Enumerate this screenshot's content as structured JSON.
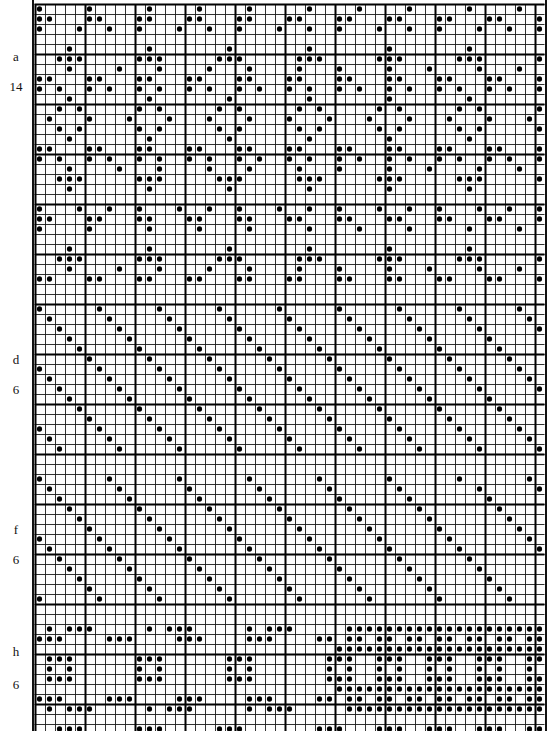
{
  "document": {
    "type": "filet-crochet-chart",
    "title": "",
    "page_width": 559,
    "page_height": 740
  },
  "margin_labels": [
    {
      "letter": "a",
      "number": "14",
      "letter_y": 50,
      "number_y": 80
    },
    {
      "letter": "d",
      "number": "6",
      "letter_y": 353,
      "number_y": 383
    },
    {
      "letter": "f",
      "number": "6",
      "letter_y": 523,
      "number_y": 553
    },
    {
      "letter": "h",
      "number": "6",
      "letter_y": 645,
      "number_y": 678
    }
  ],
  "grid": {
    "left": 32,
    "top": 4,
    "cols": 51,
    "rows": 73,
    "cell_w": 10.0,
    "cell_h": 10.0,
    "thin_line_color": "#1a1a1a",
    "heavy_line_color": "#000000",
    "thin_line_width": 0.9,
    "heavy_line_width": 2.0,
    "heavy_every": 5,
    "background": "#fdfdfd",
    "dot_color": "#000000",
    "dot_radius": 2.6
  },
  "chart_data": {
    "type": "heatmap",
    "title": "",
    "xlabel": "",
    "ylabel": "",
    "legend": [],
    "categories": [],
    "sections": [
      {
        "id": "a",
        "repeat": "14",
        "row_start": 0,
        "row_end": 27
      },
      {
        "id": "d",
        "repeat": "6",
        "row_start": 30,
        "row_end": 44
      },
      {
        "id": "f",
        "repeat": "6",
        "row_start": 47,
        "row_end": 60
      },
      {
        "id": "h",
        "repeat": "6",
        "row_start": 62,
        "row_end": 72
      }
    ],
    "rows": [
      "100001000001000010000100000100001000010000010000100",
      "110001100011000110001100011000110001100011000110001",
      "100010010010001001001000100100100010010010001001001",
      "000000000000000000000000000000000000000000000000000",
      "000100000001000000010000000100000001000000010000000",
      "001110000011100000111000001110000011100000111000001",
      "000100001000100001000100001000100001000100001000100",
      "110001100011000110001100011000110001100011000110001",
      "101001010010100101001010010100101001010010100101001",
      "000100000001000000010000000100000001000000010000000",
      "001010000010100000101000001010000010100000101000001",
      "010001000100010001000100010001000100010001000100010",
      "001010000010100000101000001010000010100000101000001",
      "000100000001000000010000000100000001000000010000000",
      "110001100011000110001100011000110001100011000110001",
      "101001010010100101001010010100101001010010100101001",
      "000100001000100001000100001000100001000100001000100",
      "001110000011100000111000001110000011100000111000001",
      "000100000001000000010000000100000001000000010000000",
      "000000000000000000000000000000000000000000000000000",
      "100010010010001001001000100100100010010010001001001",
      "110001100011000110001100011000110001100011000110001",
      "100001000001000010000100000100001000010000010000100",
      "000000000000000000000000000000000000000000000000000",
      "000100000001000000010000000100000001000000010000000",
      "001110000011100000111000001110000011100000111000001",
      "000100001000100001000100001000100001000100001000100",
      "110001100011000110001100011000110001100011000110001",
      "000000000000000000000000000000000000000000000000000",
      "000000000000000000000000000000000000000000000000000",
      "100000100000100000100000100000100000100000100000100",
      "010000010000010000010000010000010000010000010000010",
      "001000001000001000001000001000001000001000001000001",
      "000100000100000100000100000100000100000100000100000",
      "000010000010000010000010000010000010000010000010000",
      "000001000001000001000001000001000001000001000001000",
      "100000100000100000100000100000100000100000100000100",
      "010000010000010000010000010000010000010000010000010",
      "001000001000001000001000001000001000001000001000001",
      "000100000100000100000100000100000100000100000100000",
      "000010000010000010000010000010000010000010000010000",
      "000001000001000001000001000001000001000001000001000",
      "100000100000100000100000100000100000100000100000100",
      "010000010000010000010000010000010000010000010000010",
      "001000001000001000001000001000001000001000001000001",
      "000000000000000000000000000000000000000000000000000",
      "000000000000000000000000000000000000000000000000000",
      "100000010000001000000100000010000001000000100000010",
      "010000001000000100000010000001000000100000001000001",
      "001000000100000010000001000000100000010000000100000",
      "000100000010000001000000100000010000001000000010000",
      "000010000001000000100000010000001000000100000001000",
      "000001000000100000010000001000000100000010000000100",
      "100000100000010000001000000100000010000001000000010",
      "010000010000001000000100000010000001000000100000001",
      "001000001000000100000010000001000000100000010000000",
      "000100000100000010000001000000100000010000001000000",
      "000010000010000001000000100000010000001000000100000",
      "000001000001000000100000010000001000000100000010000",
      "100000100000100000010000001000000100000010000001000",
      "000000000000000000000000000000000000000000000000000",
      "000000000000000000000000000000000000000000000000000",
      "010111000001011100000101110000011111111111111111111",
      "111000011100001110000111000011011011011011011011011",
      "000000000000000000000000000000111111111111111111111",
      "011100000011100000011100000001110011100111001110011",
      "010100000010100000010100000001010010100101001010010",
      "011100000011100000011100000001110011100111001110011",
      "000000000000000000000000000000111111111111111111111",
      "111000011100001110000111000011011011011011011011011",
      "010111000001011100000101110000011111111111111111111",
      "000000000000000000000000000000000000000000000000000",
      "001110000011100000111000000011100011100111001110011"
    ]
  }
}
